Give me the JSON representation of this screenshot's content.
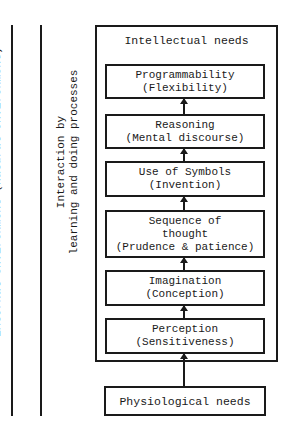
{
  "diagram": {
    "side_labels": {
      "external": "External environment (natural environment)",
      "interaction_line1": "Interaction by",
      "interaction_line2": "learning and doing processes"
    },
    "outer_title": "Intellectual needs",
    "boxes": [
      {
        "title": "Programmability",
        "subtitle": "(Flexibility)"
      },
      {
        "title": "Reasoning",
        "subtitle": "(Mental discourse)"
      },
      {
        "title": "Use of Symbols",
        "subtitle": "(Invention)"
      },
      {
        "title": "Sequence of",
        "title2": "thought",
        "subtitle": "(Prudence & patience)"
      },
      {
        "title": "Imagination",
        "subtitle": "(Conception)"
      },
      {
        "title": "Perception",
        "subtitle": "(Sensitiveness)"
      }
    ],
    "base_box": "Physiological needs",
    "colors": {
      "line": "#1a1a1a",
      "background": "#ffffff"
    }
  }
}
